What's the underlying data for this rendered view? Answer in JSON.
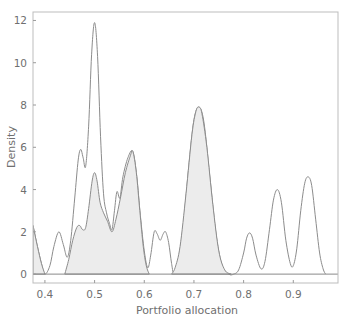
{
  "chart_data": {
    "type": "area",
    "title": "",
    "xlabel": "Portfolio allocation",
    "ylabel": "Density",
    "xlim": [
      0.376,
      0.99
    ],
    "ylim": [
      -0.42,
      12.4
    ],
    "xticks": [
      0.4,
      0.5,
      0.6,
      0.7,
      0.8,
      0.9
    ],
    "xtick_labels": [
      "0.4",
      "0.5",
      "0.6",
      "0.7",
      "0.8",
      "0.9"
    ],
    "yticks": [
      0,
      2,
      4,
      6,
      8,
      10,
      12
    ],
    "ytick_labels": [
      "0",
      "2",
      "4",
      "6",
      "8",
      "10",
      "12"
    ],
    "grid": false,
    "legend": null,
    "series": [
      {
        "name": "outline density",
        "style": "unfilled",
        "points": [
          [
            0.376,
            2.3
          ],
          [
            0.385,
            1.3
          ],
          [
            0.393,
            0.5
          ],
          [
            0.4,
            0.0
          ],
          [
            0.41,
            0.4
          ],
          [
            0.418,
            1.3
          ],
          [
            0.428,
            2.0
          ],
          [
            0.437,
            1.4
          ],
          [
            0.445,
            0.8
          ],
          [
            0.452,
            1.6
          ],
          [
            0.46,
            3.6
          ],
          [
            0.467,
            5.4
          ],
          [
            0.472,
            5.9
          ],
          [
            0.477,
            5.5
          ],
          [
            0.482,
            5.1
          ],
          [
            0.488,
            7.0
          ],
          [
            0.494,
            10.4
          ],
          [
            0.5,
            11.9
          ],
          [
            0.506,
            10.3
          ],
          [
            0.512,
            6.5
          ],
          [
            0.518,
            3.8
          ],
          [
            0.524,
            2.9
          ],
          [
            0.53,
            2.4
          ],
          [
            0.535,
            2.1
          ],
          [
            0.54,
            3.0
          ],
          [
            0.545,
            3.9
          ],
          [
            0.551,
            3.6
          ],
          [
            0.557,
            4.6
          ],
          [
            0.567,
            5.5
          ],
          [
            0.577,
            5.8
          ],
          [
            0.585,
            4.6
          ],
          [
            0.592,
            2.8
          ],
          [
            0.6,
            1.1
          ],
          [
            0.607,
            0.3
          ],
          [
            0.613,
            0.9
          ],
          [
            0.62,
            2.0
          ],
          [
            0.626,
            1.9
          ],
          [
            0.632,
            1.6
          ],
          [
            0.638,
            1.9
          ],
          [
            0.643,
            2.0
          ],
          [
            0.649,
            1.5
          ],
          [
            0.655,
            0.5
          ],
          [
            0.66,
            0.0
          ],
          [
            0.668,
            0.6
          ],
          [
            0.678,
            2.2
          ],
          [
            0.69,
            5.2
          ],
          [
            0.7,
            7.3
          ],
          [
            0.71,
            7.9
          ],
          [
            0.72,
            7.2
          ],
          [
            0.732,
            4.6
          ],
          [
            0.745,
            1.8
          ],
          [
            0.757,
            0.4
          ],
          [
            0.77,
            0.0
          ],
          [
            0.78,
            0.0
          ],
          [
            0.79,
            0.2
          ],
          [
            0.8,
            1.0
          ],
          [
            0.806,
            1.7
          ],
          [
            0.812,
            1.95
          ],
          [
            0.818,
            1.7
          ],
          [
            0.825,
            0.9
          ],
          [
            0.835,
            0.25
          ],
          [
            0.843,
            0.6
          ],
          [
            0.852,
            2.1
          ],
          [
            0.86,
            3.5
          ],
          [
            0.868,
            4.0
          ],
          [
            0.876,
            3.4
          ],
          [
            0.885,
            1.6
          ],
          [
            0.894,
            0.5
          ],
          [
            0.9,
            0.4
          ],
          [
            0.907,
            1.2
          ],
          [
            0.915,
            3.0
          ],
          [
            0.923,
            4.3
          ],
          [
            0.93,
            4.6
          ],
          [
            0.937,
            4.2
          ],
          [
            0.945,
            2.6
          ],
          [
            0.953,
            1.0
          ],
          [
            0.96,
            0.25
          ],
          [
            0.965,
            0.0
          ]
        ]
      },
      {
        "name": "filled density",
        "style": "filled",
        "segments": [
          [
            [
              0.376,
              2.3
            ],
            [
              0.385,
              1.3
            ],
            [
              0.393,
              0.5
            ],
            [
              0.4,
              0.0
            ]
          ],
          [
            [
              0.44,
              0.0
            ],
            [
              0.448,
              0.7
            ],
            [
              0.456,
              1.6
            ],
            [
              0.464,
              2.2
            ],
            [
              0.47,
              2.3
            ],
            [
              0.476,
              2.1
            ],
            [
              0.482,
              2.2
            ],
            [
              0.488,
              3.1
            ],
            [
              0.495,
              4.4
            ],
            [
              0.5,
              4.8
            ],
            [
              0.505,
              4.4
            ],
            [
              0.511,
              3.4
            ],
            [
              0.518,
              2.9
            ],
            [
              0.526,
              2.5
            ],
            [
              0.535,
              2.0
            ],
            [
              0.543,
              2.6
            ],
            [
              0.552,
              3.6
            ],
            [
              0.562,
              4.8
            ],
            [
              0.572,
              5.6
            ],
            [
              0.577,
              5.8
            ],
            [
              0.584,
              4.8
            ],
            [
              0.591,
              3.0
            ],
            [
              0.598,
              1.3
            ],
            [
              0.604,
              0.4
            ],
            [
              0.61,
              0.0
            ]
          ],
          [
            [
              0.655,
              0.0
            ],
            [
              0.662,
              0.3
            ],
            [
              0.672,
              1.3
            ],
            [
              0.684,
              3.8
            ],
            [
              0.696,
              6.6
            ],
            [
              0.704,
              7.7
            ],
            [
              0.71,
              7.9
            ],
            [
              0.716,
              7.6
            ],
            [
              0.726,
              6.0
            ],
            [
              0.738,
              3.3
            ],
            [
              0.75,
              1.1
            ],
            [
              0.762,
              0.2
            ],
            [
              0.775,
              0.0
            ]
          ]
        ]
      }
    ]
  }
}
